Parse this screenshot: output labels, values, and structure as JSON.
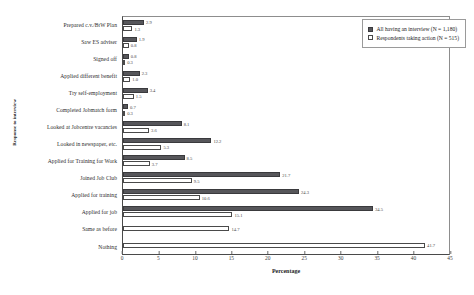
{
  "chart_data": {
    "type": "bar",
    "orientation": "horizontal",
    "title": "",
    "xlabel": "Percentage",
    "ylabel": "Response to interview",
    "xlim": [
      0,
      45
    ],
    "xticks": [
      0,
      5,
      10,
      15,
      20,
      25,
      30,
      35,
      40,
      45
    ],
    "grid": false,
    "legend_position": "top-right",
    "categories": [
      "Prepared c.v./BtW Plan",
      "Saw ES adviser",
      "Signed off",
      "Applied different benefit",
      "Try self-employment",
      "Completed Jobmatch form",
      "Looked at Jobcentre vacancies",
      "Looked in newspaper, etc.",
      "Applied for Training for Work",
      "Joined Job Club",
      "Applied for training",
      "Applied for job",
      "Same as before",
      "Nothing"
    ],
    "series": [
      {
        "name": "All having an interview (N = 1,180)",
        "color": "#56565a",
        "values": [
          2.9,
          1.9,
          0.8,
          2.3,
          3.4,
          0.7,
          8.1,
          12.2,
          8.5,
          21.7,
          24.3,
          34.5,
          null,
          null
        ]
      },
      {
        "name": "Respondents taking action (N = 515)",
        "color": "#ffffff",
        "values": [
          1.3,
          0.8,
          0.3,
          1.0,
          1.5,
          0.3,
          3.6,
          5.3,
          3.7,
          9.5,
          10.6,
          15.1,
          14.7,
          41.7
        ]
      }
    ]
  }
}
